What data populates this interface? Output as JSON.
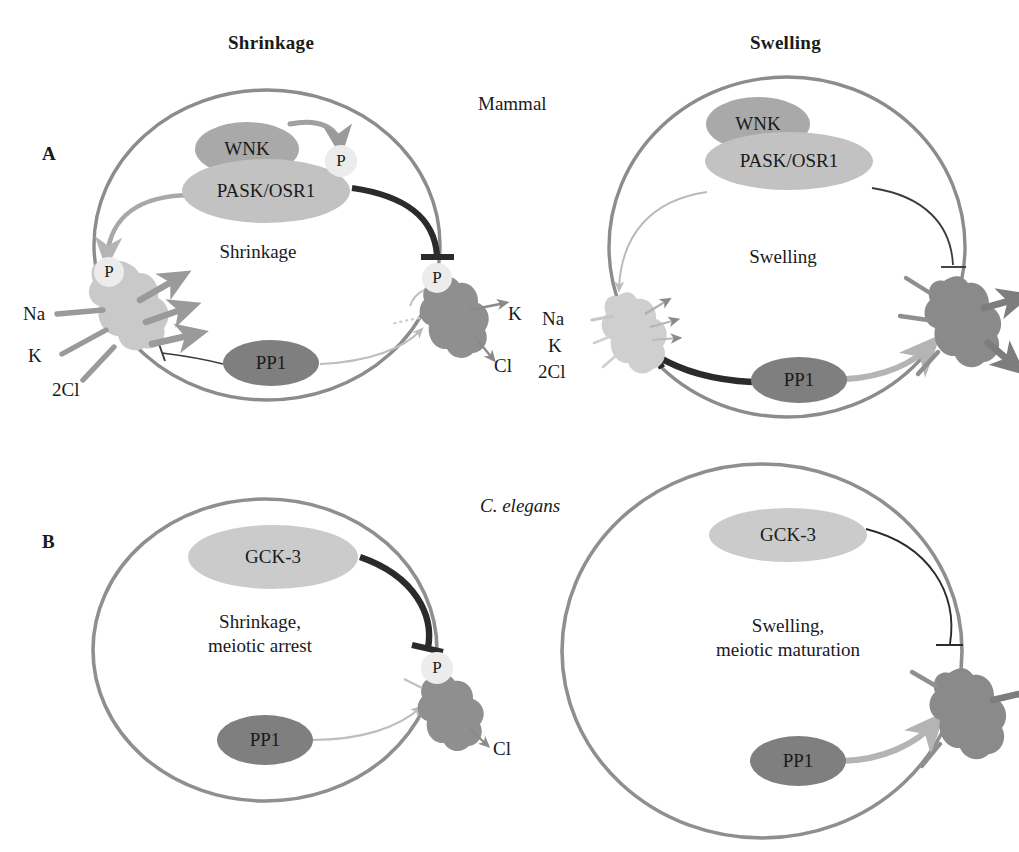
{
  "figure": {
    "columns": [
      {
        "label": "Shrinkage"
      },
      {
        "label": "Swelling"
      }
    ],
    "organisms": [
      {
        "label": "Mammal"
      },
      {
        "label": "C. elegans"
      }
    ],
    "panels": [
      {
        "letter": "A",
        "organism": "Mammal",
        "cells": [
          {
            "condition": "Shrinkage",
            "state_label": "Shrinkage",
            "kinases": [
              {
                "name": "WNK",
                "fill": "#a9a9a9"
              },
              {
                "name": "PASK/OSR1",
                "fill": "#c2c2c2"
              }
            ],
            "phosphatase": {
              "name": "PP1",
              "fill": "#7f7f7f"
            },
            "phospho_tags": [
              {
                "name": "P",
                "target": "pask-osr1"
              },
              {
                "name": "P",
                "target": "nkcc"
              },
              {
                "name": "P",
                "target": "kcc"
              }
            ],
            "transporters": [
              {
                "name": "NKCC",
                "fill": "#c9c9c9",
                "active": true,
                "ion_labels": [
                  "Na",
                  "K",
                  "2Cl"
                ],
                "flux": "influx"
              },
              {
                "name": "KCC",
                "fill": "#8f8f8f",
                "active": false,
                "ion_labels": [
                  "K",
                  "Cl"
                ],
                "flux": "efflux"
              }
            ],
            "edges": [
              {
                "from": "WNK",
                "to": "P",
                "kind": "activate",
                "weight": "medium"
              },
              {
                "from": "PASK/OSR1",
                "to": "NKCC",
                "kind": "activate",
                "weight": "medium"
              },
              {
                "from": "PASK/OSR1",
                "to": "KCC",
                "kind": "inhibit",
                "weight": "heavy"
              },
              {
                "from": "PP1",
                "to": "NKCC",
                "kind": "inhibit",
                "weight": "thin"
              },
              {
                "from": "PP1",
                "to": "KCC",
                "kind": "activate",
                "weight": "thin"
              }
            ]
          },
          {
            "condition": "Swelling",
            "state_label": "Swelling",
            "kinases": [
              {
                "name": "WNK",
                "fill": "#a9a9a9"
              },
              {
                "name": "PASK/OSR1",
                "fill": "#c2c2c2"
              }
            ],
            "phosphatase": {
              "name": "PP1",
              "fill": "#7f7f7f"
            },
            "phospho_tags": [],
            "transporters": [
              {
                "name": "NKCC",
                "fill": "#cfcfcf",
                "active": false,
                "ion_labels": [
                  "Na",
                  "K",
                  "2Cl"
                ],
                "flux": "influx"
              },
              {
                "name": "KCC",
                "fill": "#8a8a8a",
                "active": true,
                "ion_labels": [],
                "flux": "efflux"
              }
            ],
            "edges": [
              {
                "from": "PASK/OSR1",
                "to": "NKCC",
                "kind": "activate",
                "weight": "thin"
              },
              {
                "from": "PASK/OSR1",
                "to": "KCC",
                "kind": "inhibit",
                "weight": "thin"
              },
              {
                "from": "PP1",
                "to": "NKCC",
                "kind": "inhibit",
                "weight": "heavy"
              },
              {
                "from": "PP1",
                "to": "KCC",
                "kind": "activate",
                "weight": "medium"
              }
            ]
          }
        ]
      },
      {
        "letter": "B",
        "organism": "C. elegans",
        "cells": [
          {
            "condition": "Shrinkage",
            "state_label": "Shrinkage,\nmeiotic arrest",
            "state_label_line1": "Shrinkage,",
            "state_label_line2": "meiotic arrest",
            "kinases": [
              {
                "name": "GCK-3",
                "fill": "#cbcbcb"
              }
            ],
            "phosphatase": {
              "name": "PP1",
              "fill": "#7f7f7f"
            },
            "phospho_tags": [
              {
                "name": "P",
                "target": "clc-channel"
              }
            ],
            "transporters": [
              {
                "name": "CLH-3b",
                "fill": "#8f8f8f",
                "active": false,
                "ion_labels": [
                  "Cl"
                ],
                "flux": "efflux"
              }
            ],
            "edges": [
              {
                "from": "GCK-3",
                "to": "CLH-3b",
                "kind": "inhibit",
                "weight": "heavy"
              },
              {
                "from": "PP1",
                "to": "CLH-3b",
                "kind": "activate",
                "weight": "thin"
              }
            ]
          },
          {
            "condition": "Swelling",
            "state_label": "Swelling,\nmeiotic maturation",
            "state_label_line1": "Swelling,",
            "state_label_line2": "meiotic maturation",
            "kinases": [
              {
                "name": "GCK-3",
                "fill": "#cbcbcb"
              }
            ],
            "phosphatase": {
              "name": "PP1",
              "fill": "#7f7f7f"
            },
            "phospho_tags": [],
            "transporters": [
              {
                "name": "CLH-3b",
                "fill": "#8a8a8a",
                "active": true,
                "ion_labels": [],
                "flux": "efflux"
              }
            ],
            "edges": [
              {
                "from": "GCK-3",
                "to": "CLH-3b",
                "kind": "inhibit",
                "weight": "thin"
              },
              {
                "from": "PP1",
                "to": "CLH-3b",
                "kind": "activate",
                "weight": "medium"
              }
            ]
          }
        ]
      }
    ],
    "glyphs": {
      "phospho": "P",
      "ion_na": "Na",
      "ion_k": "K",
      "ion_2cl": "2Cl",
      "ion_cl": "Cl"
    },
    "colors": {
      "membrane": "#8c8c8c",
      "membrane_b": "#8f8f8f",
      "ink": "#1a1a1a",
      "heavy_edge": "#2b2b2b",
      "light_edge": "#b4b4b4",
      "mid_edge": "#9a9a9a",
      "phospho_fill": "#ececec",
      "background": "#ffffff"
    }
  }
}
